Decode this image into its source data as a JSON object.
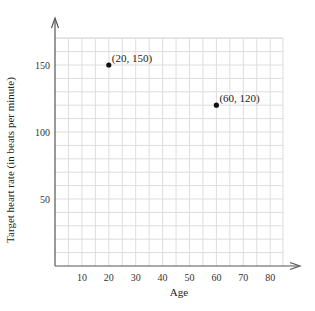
{
  "chart_data": {
    "type": "scatter",
    "title": "",
    "xlabel": "Age",
    "ylabel": "Target heart rate (in beats per minute)",
    "xlim": [
      0,
      85
    ],
    "ylim": [
      0,
      170
    ],
    "grid": true,
    "x_ticks": [
      10,
      20,
      30,
      40,
      50,
      60,
      70,
      80
    ],
    "y_ticks": [
      50,
      100,
      150
    ],
    "x_tick_labels": [
      "10",
      "20",
      "30",
      "40",
      "50",
      "60",
      "70",
      "80"
    ],
    "y_tick_labels": [
      "50",
      "100",
      "150"
    ],
    "points": [
      {
        "x": 20,
        "y": 150,
        "label": "(20, 150)"
      },
      {
        "x": 60,
        "y": 120,
        "label": "(60, 120)"
      }
    ],
    "colors": {
      "grid": "#dddddd",
      "axis": "#555555",
      "point": "#111111"
    }
  }
}
